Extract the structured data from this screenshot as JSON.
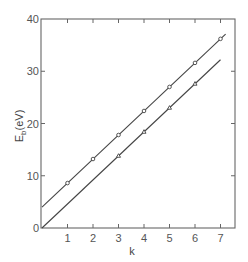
{
  "chart_data": {
    "type": "line",
    "title": "",
    "xlabel": "k",
    "ylabel": "E_b(eV)",
    "ylabel_main": "E",
    "ylabel_sub": "b",
    "ylabel_unit": "(eV)",
    "xlim": [
      0,
      7.5
    ],
    "ylim": [
      0,
      40
    ],
    "xticks": [
      1,
      2,
      3,
      4,
      5,
      6,
      7
    ],
    "yticks": [
      0,
      10,
      20,
      30,
      40
    ],
    "grid": false,
    "legend": null,
    "series": [
      {
        "name": "upper",
        "marker": "circle",
        "x": [
          1,
          2,
          3,
          4,
          5,
          6,
          7
        ],
        "y": [
          8.6,
          13.2,
          17.8,
          22.4,
          27.0,
          31.6,
          36.2
        ],
        "fit": {
          "intercept": 4.0,
          "slope": 4.6,
          "x_range": [
            0,
            7.2
          ]
        }
      },
      {
        "name": "lower",
        "marker": "triangle",
        "x": [
          3,
          4,
          5,
          6
        ],
        "y": [
          13.8,
          18.4,
          23.0,
          27.6
        ],
        "fit": {
          "intercept": 0.0,
          "slope": 4.6,
          "x_range": [
            0,
            7.0
          ]
        }
      }
    ]
  },
  "colors": {
    "line": "#444444",
    "axis": "#666666",
    "text": "#555555"
  }
}
